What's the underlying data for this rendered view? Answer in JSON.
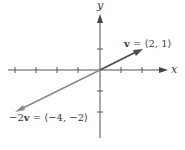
{
  "diagram": {
    "type": "vector-plot",
    "axes": {
      "x_label": "x",
      "y_label": "y",
      "x_ticks": [
        -4,
        -3,
        -2,
        -1,
        1,
        2
      ],
      "y_ticks": [
        -2,
        -1,
        1
      ],
      "x_range": [
        -4.5,
        3.2
      ],
      "y_range": [
        -3.2,
        2.7
      ]
    },
    "vectors": [
      {
        "name": "v",
        "components": [
          2,
          1
        ],
        "label_prefix": "v",
        "label_rest": " = ⟨2, 1⟩",
        "color": "#4a4a4a"
      },
      {
        "name": "-2v",
        "components": [
          -4,
          -2
        ],
        "label_prefix": "−2",
        "label_bold": "v",
        "label_rest": " = ⟨−4, −2⟩",
        "color": "#8a8a8a"
      }
    ],
    "colors": {
      "axis": "#555555",
      "v": "#4a4a4a",
      "neg2v": "#8a8a8a"
    }
  }
}
